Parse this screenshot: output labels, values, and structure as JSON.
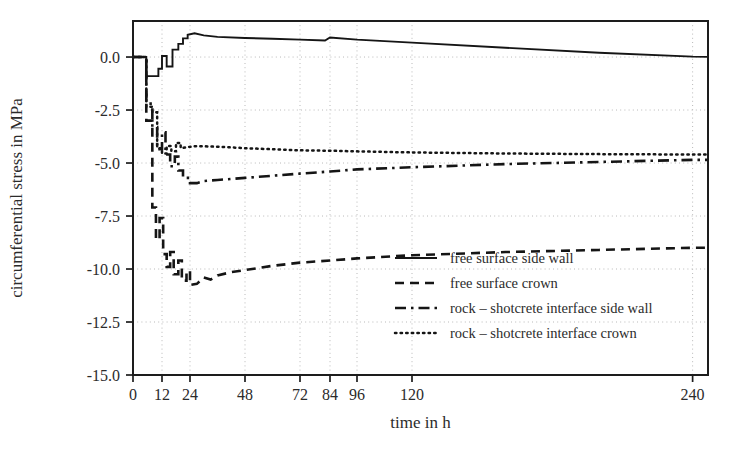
{
  "chart_data": {
    "type": "line",
    "title": "",
    "xlabel": "time in h",
    "ylabel": "circumferential stress in MPa",
    "xlim": [
      0,
      250
    ],
    "ylim": [
      -15.0,
      1.7
    ],
    "grid": true,
    "legend_position": "lower right",
    "xticks": [
      0,
      12,
      24,
      48,
      72,
      84,
      96,
      120,
      240
    ],
    "xtick_labels": [
      "0",
      "12",
      "24",
      "48",
      "72",
      "84",
      "96",
      "120",
      "240"
    ],
    "yticks": [
      0.0,
      -2.5,
      -5.0,
      -7.5,
      -10.0,
      -12.5,
      -15.0
    ],
    "ytick_labels": [
      "0.0",
      "-2.5",
      "-5.0",
      "-7.5",
      "-10.0",
      "-12.5",
      "-15.0"
    ],
    "series": [
      {
        "name": "free surface side wall",
        "style": "solid",
        "points": [
          [
            0,
            0.0
          ],
          [
            5.5,
            0.0
          ],
          [
            5.5,
            -0.9
          ],
          [
            10.5,
            -0.9
          ],
          [
            10.5,
            -0.55
          ],
          [
            12.0,
            -0.55
          ],
          [
            12.0,
            0.05
          ],
          [
            14.0,
            0.05
          ],
          [
            14.0,
            -0.45
          ],
          [
            16.5,
            -0.45
          ],
          [
            16.5,
            0.35
          ],
          [
            19.0,
            0.35
          ],
          [
            19.0,
            0.62
          ],
          [
            21.0,
            0.62
          ],
          [
            21.0,
            0.88
          ],
          [
            23.0,
            0.88
          ],
          [
            23.0,
            1.05
          ],
          [
            26.0,
            1.12
          ],
          [
            30.0,
            1.02
          ],
          [
            36.0,
            0.95
          ],
          [
            48.0,
            0.9
          ],
          [
            60.0,
            0.86
          ],
          [
            72.0,
            0.82
          ],
          [
            82.0,
            0.78
          ],
          [
            84.0,
            0.92
          ],
          [
            96.0,
            0.82
          ],
          [
            120.0,
            0.68
          ],
          [
            160.0,
            0.44
          ],
          [
            200.0,
            0.2
          ],
          [
            240.0,
            0.02
          ],
          [
            250.0,
            0.0
          ]
        ]
      },
      {
        "name": "free surface crown",
        "style": "dashed",
        "points": [
          [
            0,
            0.0
          ],
          [
            5.5,
            0.0
          ],
          [
            5.5,
            -3.0
          ],
          [
            8.0,
            -3.0
          ],
          [
            8.0,
            -7.1
          ],
          [
            9.5,
            -7.1
          ],
          [
            9.5,
            -8.6
          ],
          [
            11.0,
            -8.6
          ],
          [
            11.0,
            -7.6
          ],
          [
            12.5,
            -7.6
          ],
          [
            12.5,
            -9.3
          ],
          [
            14.0,
            -9.3
          ],
          [
            14.0,
            -9.9
          ],
          [
            15.5,
            -9.9
          ],
          [
            15.5,
            -9.2
          ],
          [
            17.0,
            -9.2
          ],
          [
            17.0,
            -10.25
          ],
          [
            19.0,
            -10.25
          ],
          [
            19.0,
            -9.6
          ],
          [
            20.5,
            -9.6
          ],
          [
            20.5,
            -10.55
          ],
          [
            22.5,
            -10.55
          ],
          [
            22.5,
            -10.1
          ],
          [
            24.0,
            -10.1
          ],
          [
            24.0,
            -10.75
          ],
          [
            27.0,
            -10.7
          ],
          [
            30.0,
            -10.4
          ],
          [
            33.0,
            -10.5
          ],
          [
            36.0,
            -10.3
          ],
          [
            42.0,
            -10.15
          ],
          [
            48.0,
            -10.05
          ],
          [
            60.0,
            -9.85
          ],
          [
            72.0,
            -9.7
          ],
          [
            84.0,
            -9.6
          ],
          [
            96.0,
            -9.5
          ],
          [
            120.0,
            -9.35
          ],
          [
            160.0,
            -9.2
          ],
          [
            200.0,
            -9.1
          ],
          [
            240.0,
            -9.0
          ],
          [
            250.0,
            -9.0
          ]
        ]
      },
      {
        "name": "rock - shotcrete interface side wall",
        "style": "dashdot",
        "points": [
          [
            0,
            0.0
          ],
          [
            5.5,
            0.0
          ],
          [
            5.5,
            -2.2
          ],
          [
            8.0,
            -2.2
          ],
          [
            8.0,
            -3.3
          ],
          [
            10.0,
            -3.3
          ],
          [
            10.0,
            -4.35
          ],
          [
            12.0,
            -4.35
          ],
          [
            12.0,
            -3.55
          ],
          [
            13.5,
            -3.55
          ],
          [
            13.5,
            -4.6
          ],
          [
            15.5,
            -4.6
          ],
          [
            15.5,
            -5.15
          ],
          [
            17.5,
            -5.15
          ],
          [
            17.5,
            -4.7
          ],
          [
            19.0,
            -4.7
          ],
          [
            19.0,
            -5.35
          ],
          [
            21.0,
            -5.35
          ],
          [
            21.0,
            -5.7
          ],
          [
            24.0,
            -5.7
          ],
          [
            24.0,
            -5.95
          ],
          [
            27.0,
            -5.95
          ],
          [
            30.0,
            -5.85
          ],
          [
            36.0,
            -5.8
          ],
          [
            48.0,
            -5.7
          ],
          [
            60.0,
            -5.6
          ],
          [
            72.0,
            -5.5
          ],
          [
            84.0,
            -5.4
          ],
          [
            96.0,
            -5.3
          ],
          [
            120.0,
            -5.2
          ],
          [
            160.0,
            -5.05
          ],
          [
            200.0,
            -4.95
          ],
          [
            240.0,
            -4.85
          ],
          [
            250.0,
            -4.85
          ]
        ]
      },
      {
        "name": "rock - shotcrete interface crown",
        "style": "dotted",
        "points": [
          [
            0,
            0.0
          ],
          [
            5.5,
            0.0
          ],
          [
            5.5,
            -2.35
          ],
          [
            8.0,
            -2.35
          ],
          [
            8.0,
            -2.6
          ],
          [
            10.0,
            -2.6
          ],
          [
            10.0,
            -4.3
          ],
          [
            12.0,
            -4.3
          ],
          [
            12.0,
            -4.55
          ],
          [
            14.0,
            -4.55
          ],
          [
            14.0,
            -4.2
          ],
          [
            16.0,
            -4.2
          ],
          [
            16.0,
            -4.45
          ],
          [
            18.0,
            -4.45
          ],
          [
            18.0,
            -4.05
          ],
          [
            20.0,
            -4.05
          ],
          [
            20.0,
            -4.3
          ],
          [
            23.0,
            -4.25
          ],
          [
            27.0,
            -4.2
          ],
          [
            33.0,
            -4.22
          ],
          [
            40.0,
            -4.25
          ],
          [
            48.0,
            -4.3
          ],
          [
            60.0,
            -4.35
          ],
          [
            72.0,
            -4.4
          ],
          [
            84.0,
            -4.42
          ],
          [
            96.0,
            -4.45
          ],
          [
            120.0,
            -4.5
          ],
          [
            160.0,
            -4.55
          ],
          [
            200.0,
            -4.58
          ],
          [
            240.0,
            -4.6
          ],
          [
            250.0,
            -4.6
          ]
        ]
      }
    ],
    "legend_entries": [
      {
        "label": "free surface side wall",
        "style": "solid"
      },
      {
        "label": "free surface crown",
        "style": "dashed"
      },
      {
        "label": "rock – shotcrete interface side wall",
        "style": "dashdot"
      },
      {
        "label": "rock – shotcrete interface crown",
        "style": "dotted"
      }
    ]
  }
}
